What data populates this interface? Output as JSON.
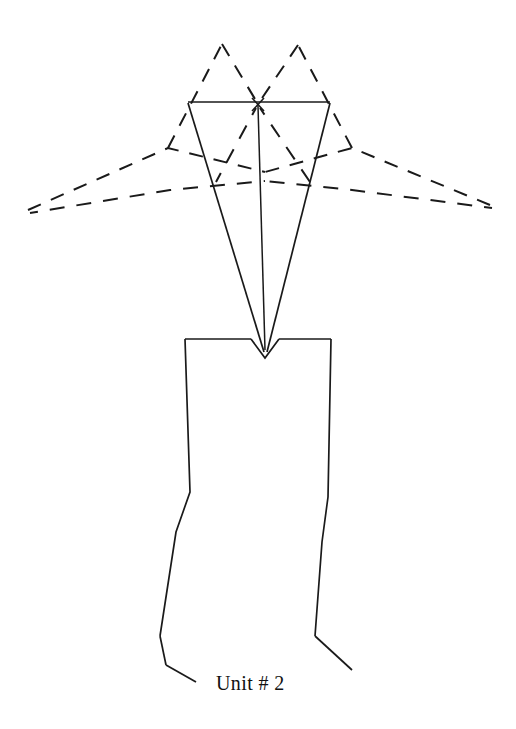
{
  "figure": {
    "caption": "Unit # 2",
    "caption_position": {
      "x": 216,
      "y": 690
    },
    "background_color": "#ffffff",
    "line_color": "#1a1a1a",
    "width": 516,
    "height": 729,
    "elements": {
      "center_marker_label": "x-marker",
      "upper_triangle_label": "solid-triangle",
      "lower_body_label": "solid-body-outline",
      "dashed_field_label": "dashed-field-lines"
    },
    "geometry": {
      "triangle_top_bar": "188,102 330,102",
      "triangle_left_edge": "188,102 265,355",
      "triangle_right_edge": "330,102 265,355",
      "center_axis": "258,106 265,352",
      "x_marker_center": "258,104",
      "body_outline": "185,339 188,492 176,530 160,637 165,665",
      "body_outline_right": "331,339 327,497 322,540 316,635 352,670",
      "notch": "251,339 265,358 279,339",
      "dashed_peak_left": "222,44",
      "dashed_peak_right": "298,45",
      "dashed_left_end": "28,210",
      "dashed_right_end": "490,205",
      "dashed_mid_left_peak": "168,148",
      "dashed_mid_right_peak": "352,148",
      "dashed_center_arc": "265,172"
    }
  }
}
